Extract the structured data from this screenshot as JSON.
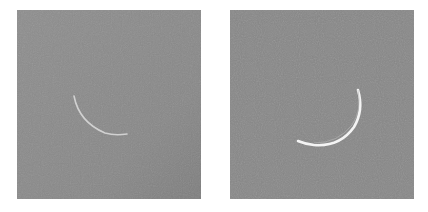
{
  "panels": [
    {
      "id": "left",
      "subject": "thin crescent moon",
      "background_color": "#8a8a8a",
      "crescent_brightness": "faint"
    },
    {
      "id": "right",
      "subject": "crescent moon",
      "background_color": "#8a8a8a",
      "crescent_brightness": "bright"
    }
  ]
}
